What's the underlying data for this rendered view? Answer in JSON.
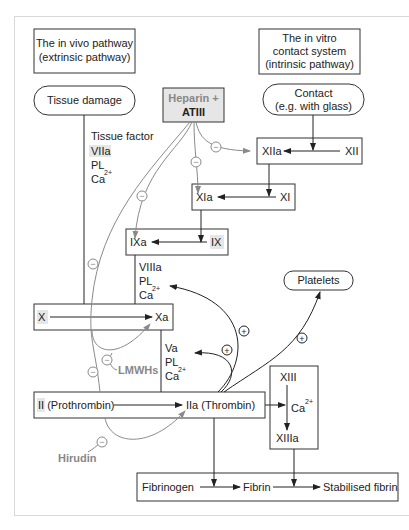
{
  "pathways": {
    "extrinsic": {
      "line1": "The in vivo pathway",
      "line2": "(extrinsic pathway)"
    },
    "intrinsic": {
      "line1": "The in vitro",
      "line2": "contact system",
      "line3": "(intrinsic pathway)"
    }
  },
  "triggers": {
    "tissue_damage": "Tissue damage",
    "contact_line1": "Contact",
    "contact_line2": "(e.g. with glass)",
    "platelets": "Platelets"
  },
  "inhibitors": {
    "heparin": "Heparin +",
    "atiii": "ATIII",
    "lmwhs": "LMWHs",
    "hirudin": "Hirudin"
  },
  "cofactors": {
    "extrinsic": {
      "tf": "Tissue factor",
      "f7a": "VIIa",
      "pl": "PL",
      "ca": "Ca",
      "ca_sup": "2+"
    },
    "tenase": {
      "f8a": "VIIIa",
      "pl": "PL",
      "ca": "Ca",
      "ca_sup": "2+"
    },
    "prothrombinase": {
      "f5a": "Va",
      "pl": "PL",
      "ca": "Ca",
      "ca_sup": "2+"
    }
  },
  "factors": {
    "xii": "XII",
    "xiia": "XIIa",
    "xi": "XI",
    "xia": "XIa",
    "ix": "IX",
    "ixa": "IXa",
    "x": "X",
    "xa": "Xa",
    "ii": "II",
    "prothrombin": " (Prothrombin)",
    "iia": "IIa (Thrombin)",
    "xiii": "XIII",
    "xiii_ca": "Ca",
    "xiii_ca_sup": "2+",
    "xiiia": "XIIIa",
    "fibrinogen": "Fibrinogen",
    "fibrin": "Fibrin",
    "stabilised": "Stabilised fibrin"
  },
  "symbols": {
    "minus": "−",
    "plus": "+"
  },
  "colors": {
    "line": "#222222",
    "inhibitor": "#8a8a8a",
    "highlight": "#e6e6e6",
    "border": "#333333"
  }
}
